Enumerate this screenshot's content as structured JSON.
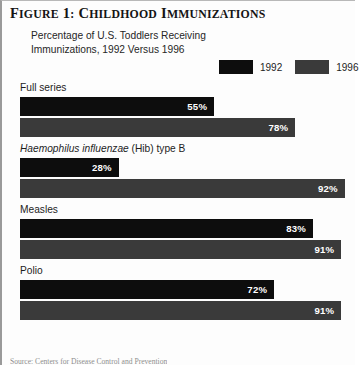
{
  "figure": {
    "title_prefix": "F",
    "title": "FIGURE 1: CHILDHOOD IMMUNIZATIONS",
    "title_part1": "Figure 1: ",
    "title_part2": "Childhood Immunizations",
    "subtitle": "Percentage of U.S. Toddlers Receiving Immunizations, 1992 Versus 1996",
    "source_note": "Source: Centers for Disease Control and Prevention"
  },
  "colors": {
    "series_1992": "#0d0d0d",
    "series_1996": "#3a3a3a",
    "value_text": "#ffffff",
    "background": "#fdfdfd",
    "border": "#9a9a9a"
  },
  "legend": {
    "items": [
      {
        "label": "1992",
        "color": "#0d0d0d"
      },
      {
        "label": "1996",
        "color": "#3a3a3a"
      }
    ]
  },
  "chart_data": {
    "type": "bar",
    "title": "Percentage of U.S. Toddlers Receiving Immunizations, 1992 Versus 1996",
    "xlabel": "",
    "ylabel": "",
    "xlim": [
      0,
      100
    ],
    "grid": false,
    "orientation": "horizontal",
    "legend_position": "top-right",
    "value_suffix": "%",
    "categories": [
      "Full series",
      "Haemophilus influenzae (Hib) type B",
      "Measles",
      "Polio"
    ],
    "series": [
      {
        "name": "1992",
        "color": "#0d0d0d",
        "values": [
          55,
          28,
          83,
          72
        ]
      },
      {
        "name": "1996",
        "color": "#3a3a3a",
        "values": [
          78,
          92,
          91,
          91
        ]
      }
    ],
    "groups": [
      {
        "label": "Full series",
        "label_italic": "",
        "label_roman": "Full series",
        "bars": [
          {
            "series": "1992",
            "value": 55,
            "value_text": "55%",
            "color": "#0d0d0d"
          },
          {
            "series": "1996",
            "value": 78,
            "value_text": "78%",
            "color": "#3a3a3a"
          }
        ]
      },
      {
        "label": "Haemophilus influenzae (Hib) type B",
        "label_italic": "Haemophilus influenzae",
        "label_roman": " (Hib) type B",
        "bars": [
          {
            "series": "1992",
            "value": 28,
            "value_text": "28%",
            "color": "#0d0d0d"
          },
          {
            "series": "1996",
            "value": 92,
            "value_text": "92%",
            "color": "#3a3a3a"
          }
        ]
      },
      {
        "label": "Measles",
        "label_italic": "",
        "label_roman": "Measles",
        "bars": [
          {
            "series": "1992",
            "value": 83,
            "value_text": "83%",
            "color": "#0d0d0d"
          },
          {
            "series": "1996",
            "value": 91,
            "value_text": "91%",
            "color": "#3a3a3a"
          }
        ]
      },
      {
        "label": "Polio",
        "label_italic": "",
        "label_roman": "Polio",
        "bars": [
          {
            "series": "1992",
            "value": 72,
            "value_text": "72%",
            "color": "#0d0d0d"
          },
          {
            "series": "1996",
            "value": 91,
            "value_text": "91%",
            "color": "#3a3a3a"
          }
        ]
      }
    ]
  }
}
